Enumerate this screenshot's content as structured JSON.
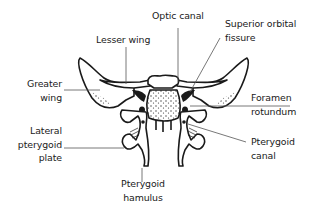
{
  "diagram": {
    "line_color": "#1a1a1a",
    "leader_color": "#555555",
    "stipple_color": "#333333",
    "labels": {
      "optic_canal": "Optic canal",
      "superior_orbital_fissure": "Superior orbital\nfissure",
      "lesser_wing": "Lesser wing",
      "greater_wing": "Greater\nwing",
      "foramen_rotundum": "Foramen\nrotundum",
      "lateral_pterygoid_plate": "Lateral\npterygoid\nplate",
      "pterygoid_canal": "Pterygoid\ncanal",
      "pterygoid_hamulus": "Pterygoid\nhamulus"
    }
  }
}
